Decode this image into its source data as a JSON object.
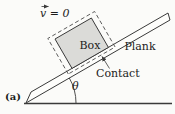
{
  "figure": {
    "type": "physics-incline-diagram",
    "panel_label": "(a)",
    "labels": {
      "velocity": "v = 0",
      "box": "Box",
      "plank": "Plank",
      "contact": "Contact",
      "angle": "θ"
    },
    "annotations": {
      "velocity_note": "vector arrow drawn above the v symbol",
      "contact_note": "leader line with arrowhead pointing to box–plank interface",
      "boundary_note": "dashed system boundary enclosing box and contact region"
    },
    "angle_degrees_drawn": 30,
    "colors": {
      "line": "#3a3a3a",
      "text": "#1c1c1c",
      "box_fill": "#dbdbd8",
      "plank_fill": "#fdfdfb",
      "background": "#fbfbf9"
    }
  }
}
